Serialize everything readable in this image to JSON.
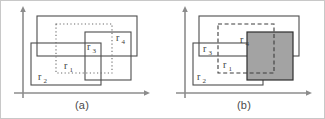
{
  "figure": {
    "background_color": "#ffffff",
    "frame_color": "#c8c8c8",
    "line_color": "#4d4d4d",
    "axis_color": "#8c8c8c",
    "shade_color": "#a3a3a3",
    "shade_stroke_color": "#2e2e2e",
    "label_color": "#3c3c3c"
  },
  "panels": [
    {
      "id": "a",
      "caption": "(a)",
      "axes": {
        "x_axis_name": "x-axis",
        "y_axis_name": "y-axis",
        "arrowheads": true
      },
      "rectangles": [
        {
          "name": "r3",
          "label": "r",
          "subscript": "3",
          "style": "solid",
          "filled": false
        },
        {
          "name": "r4",
          "label": "r",
          "subscript": "4",
          "style": "solid",
          "filled": false
        },
        {
          "name": "r1",
          "label": "r",
          "subscript": "1",
          "style": "dotted",
          "filled": false
        },
        {
          "name": "r2",
          "label": "r",
          "subscript": "2",
          "style": "solid",
          "filled": false
        }
      ]
    },
    {
      "id": "b",
      "caption": "(b)",
      "axes": {
        "x_axis_name": "x-axis",
        "y_axis_name": "y-axis",
        "arrowheads": true
      },
      "rectangles": [
        {
          "name": "r3",
          "label": "r",
          "subscript": "3",
          "style": "solid",
          "filled": false
        },
        {
          "name": "r4",
          "label": "r",
          "subscript": "4",
          "style": "solid",
          "filled": true
        },
        {
          "name": "r1",
          "label": "r",
          "subscript": "1",
          "style": "dashed",
          "filled": false
        },
        {
          "name": "r2",
          "label": "r",
          "subscript": "2",
          "style": "solid",
          "filled": false
        }
      ]
    }
  ],
  "labels": {
    "r1": "r",
    "r1_sub": "1",
    "r2": "r",
    "r2_sub": "2",
    "r3": "r",
    "r3_sub": "3",
    "r4": "r",
    "r4_sub": "4",
    "caption_a": "(a)",
    "caption_b": "(b)"
  }
}
